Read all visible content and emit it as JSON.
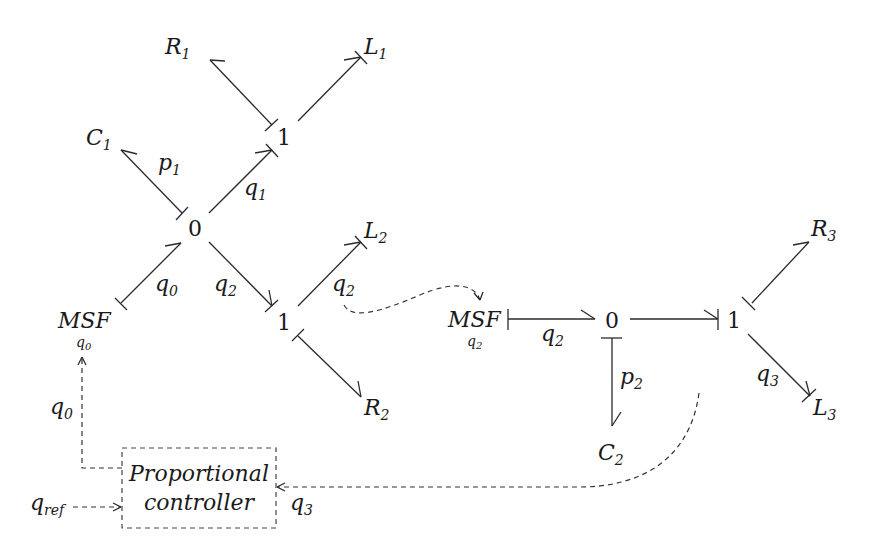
{
  "diagram": {
    "type": "bond-graph",
    "nodes": {
      "R1": {
        "base": "R",
        "sub": "1"
      },
      "L1": {
        "base": "L",
        "sub": "1"
      },
      "one_top": {
        "label": "1"
      },
      "C1": {
        "base": "C",
        "sub": "1"
      },
      "zero_left": {
        "label": "0"
      },
      "L2": {
        "base": "L",
        "sub": "2"
      },
      "MSF_left": {
        "base": "MSF",
        "sub": "q",
        "subsub": "0"
      },
      "one_mid": {
        "label": "1"
      },
      "R2": {
        "base": "R",
        "sub": "2"
      },
      "MSF_right": {
        "base": "MSF",
        "sub": "q",
        "subsub": "2"
      },
      "zero_right": {
        "label": "0"
      },
      "one_right": {
        "label": "1"
      },
      "R3": {
        "base": "R",
        "sub": "3"
      },
      "L3": {
        "base": "L",
        "sub": "3"
      },
      "C2": {
        "base": "C",
        "sub": "2"
      }
    },
    "bond_labels": {
      "p1": {
        "base": "p",
        "sub": "1"
      },
      "q1": {
        "base": "q",
        "sub": "1"
      },
      "q0": {
        "base": "q",
        "sub": "0"
      },
      "q2_left": {
        "base": "q",
        "sub": "2"
      },
      "q2_mid": {
        "base": "q",
        "sub": "2"
      },
      "q2_right": {
        "base": "q",
        "sub": "2"
      },
      "p2": {
        "base": "p",
        "sub": "2"
      },
      "q3_right": {
        "base": "q",
        "sub": "3"
      }
    },
    "controller": {
      "line1": "Proportional",
      "line2": "controller",
      "input_ref": {
        "base": "q",
        "sub": "ref"
      },
      "output_label": {
        "base": "q",
        "sub": "0"
      },
      "feedback_label": {
        "base": "q",
        "sub": "3"
      }
    },
    "bonds": [
      {
        "from": "one_top",
        "to": "R1"
      },
      {
        "from": "one_top",
        "to": "L1"
      },
      {
        "from": "zero_left",
        "to": "C1",
        "label": "p1"
      },
      {
        "from": "zero_left",
        "to": "one_top",
        "label": "q1"
      },
      {
        "from": "MSF_left",
        "to": "zero_left",
        "label": "q0"
      },
      {
        "from": "zero_left",
        "to": "one_mid",
        "label": "q2"
      },
      {
        "from": "one_mid",
        "to": "L2",
        "label": "q2"
      },
      {
        "from": "one_mid",
        "to": "R2"
      },
      {
        "from": "MSF_right",
        "to": "zero_right",
        "label": "q2"
      },
      {
        "from": "zero_right",
        "to": "one_right"
      },
      {
        "from": "zero_right",
        "to": "C2",
        "label": "p2"
      },
      {
        "from": "one_right",
        "to": "R3"
      },
      {
        "from": "one_right",
        "to": "L3",
        "label": "q3"
      }
    ],
    "signals": [
      {
        "from": "one_mid bond q2",
        "to": "MSF_right"
      },
      {
        "from": "controller",
        "to": "MSF_left",
        "label": "q0"
      },
      {
        "from": "q_ref",
        "to": "controller"
      },
      {
        "from": "one_right bond q3",
        "to": "controller",
        "label": "q3"
      }
    ]
  }
}
